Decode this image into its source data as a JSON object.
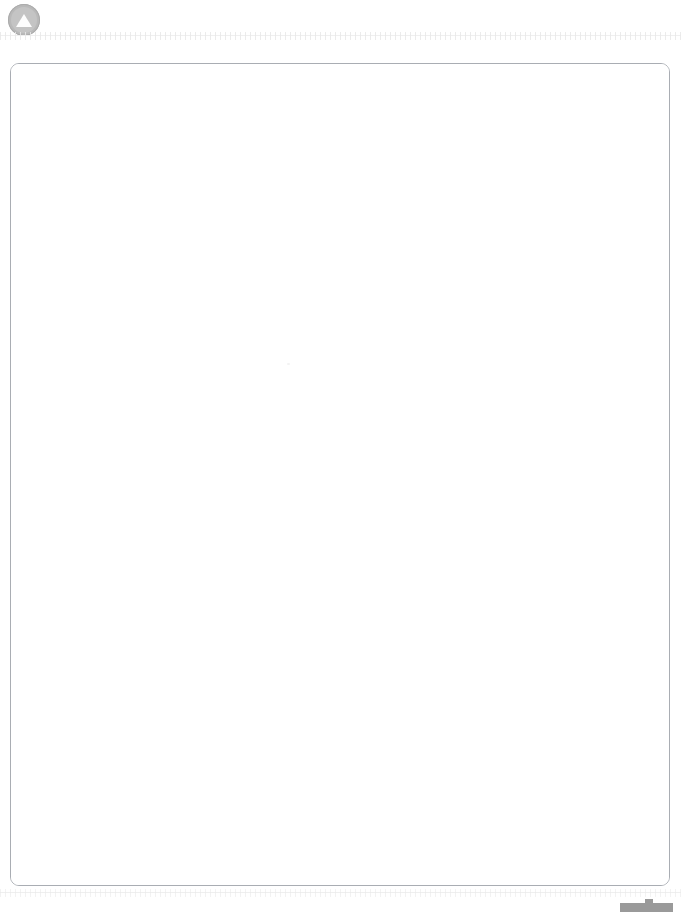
{
  "window": {
    "background_color": "#ffffff",
    "width": 681,
    "height": 912
  },
  "toolbar": {
    "logo_icon": "triangle-up-circle-icon",
    "logo_label": "",
    "logo_circle_color": "#b9b9b9",
    "logo_triangle_color": "#fdfdfd"
  },
  "rulers": {
    "top": {
      "name": "ruler-top",
      "tick_color": "#e8e8e8",
      "line_color": "#efefef"
    },
    "bottom": {
      "name": "ruler-bottom",
      "tick_color": "#e8e8e8",
      "line_color": "#efefef"
    }
  },
  "document": {
    "page_label": "",
    "page_background": "#ffffff",
    "border_color": "#a9adb3",
    "corner_radius_px": 9,
    "content_text": "",
    "is_blank": true
  },
  "bottom_widget": {
    "label": "",
    "color": "#9a9a9a",
    "icon": "scroll-thumb-handle-icon"
  }
}
